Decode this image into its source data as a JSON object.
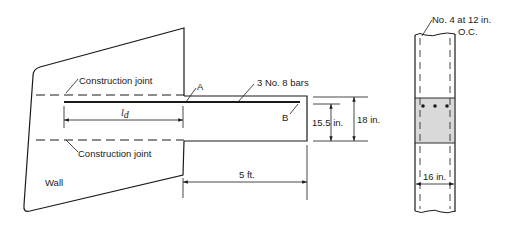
{
  "figure": {
    "elevation": {
      "wall_label": "Wall",
      "construction_joint_upper": "Construction joint",
      "construction_joint_lower": "Construction joint",
      "point_a": "A",
      "point_b": "B",
      "bars_label": "3 No. 8 bars",
      "development_length_symbol": "l",
      "development_length_subscript": "d",
      "projection_dim": "5 ft.",
      "effective_depth_dim": "15.5 in.",
      "total_depth_dim": "18 in."
    },
    "section": {
      "stirrup_label_line1": "No. 4 at 12 in.",
      "stirrup_label_line2": "O.C.",
      "width_dim": "16 in.",
      "bar_count": 3
    },
    "colors": {
      "line": "#1a1a1a",
      "section_fill": "#d9d9d9",
      "background": "#ffffff"
    }
  }
}
